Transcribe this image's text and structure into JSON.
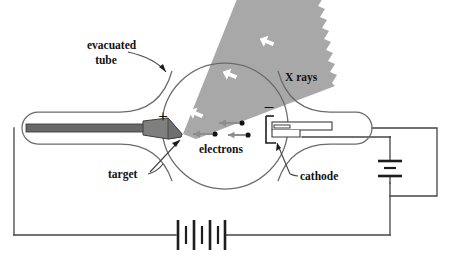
{
  "figure": {
    "type": "schematic-diagram",
    "background_color": "#ffffff"
  },
  "labels": {
    "evacuated_tube_line1": "evacuated",
    "evacuated_tube_line2": "tube",
    "x_rays": "X rays",
    "electrons": "electrons",
    "target": "target",
    "cathode": "cathode",
    "plus_sign": "+",
    "minus_sign": "–"
  },
  "colors": {
    "outline": "#555555",
    "glass_outline": "#6b6b6b",
    "beam_gray": "#a8a8a8",
    "target_gray": "#7a7a7a",
    "anode_rod_gray": "#686868",
    "electron_arrow_gray": "#8d8d8d",
    "wire": "#444444",
    "text": "#111111",
    "white": "#ffffff"
  },
  "components": {
    "evacuated_bulb": {
      "name": "evacuated tube",
      "shape": "circle",
      "center_x": 225,
      "center_y": 126,
      "radius": 63
    },
    "anode_arm": {
      "name": "anode arm",
      "description": "left horizontal tube neck with rounded cap",
      "left_x": 22,
      "right_x": 178,
      "center_y": 128
    },
    "cathode_arm": {
      "name": "cathode arm",
      "description": "right horizontal tube neck with rounded cap",
      "left_x": 270,
      "right_x": 380,
      "center_y": 128
    },
    "target": {
      "name": "target anode",
      "description": "angled wedge at inner end of anode rod",
      "tip_x": 180,
      "tip_y": 136
    },
    "cathode": {
      "name": "cathode filament assembly",
      "description": "bracket with horizontal filament bar"
    },
    "x_ray_beam": {
      "name": "x-ray beam",
      "description": "gray wedge with sawtooth far edge radiating up-right from target",
      "arrow_count": 3,
      "arrow_color": "#ffffff",
      "arrow_direction": "up-right"
    },
    "electron_stream": {
      "name": "electron stream",
      "description": "three gray arrows with black dots travelling leftward from cathode to target",
      "arrow_count": 3,
      "dot_color": "#111111",
      "direction": "left"
    },
    "main_battery": {
      "name": "high voltage battery",
      "orientation": "horizontal",
      "position": "bottom",
      "cell_count": 3,
      "plate_count": 7
    },
    "filament_battery": {
      "name": "filament battery",
      "orientation": "vertical",
      "position": "right",
      "cell_count": 1,
      "plate_count": 3
    },
    "circuit": {
      "name": "external circuit wiring",
      "description": "rectangular loop connecting anode rod, main battery, filament battery and cathode"
    }
  }
}
